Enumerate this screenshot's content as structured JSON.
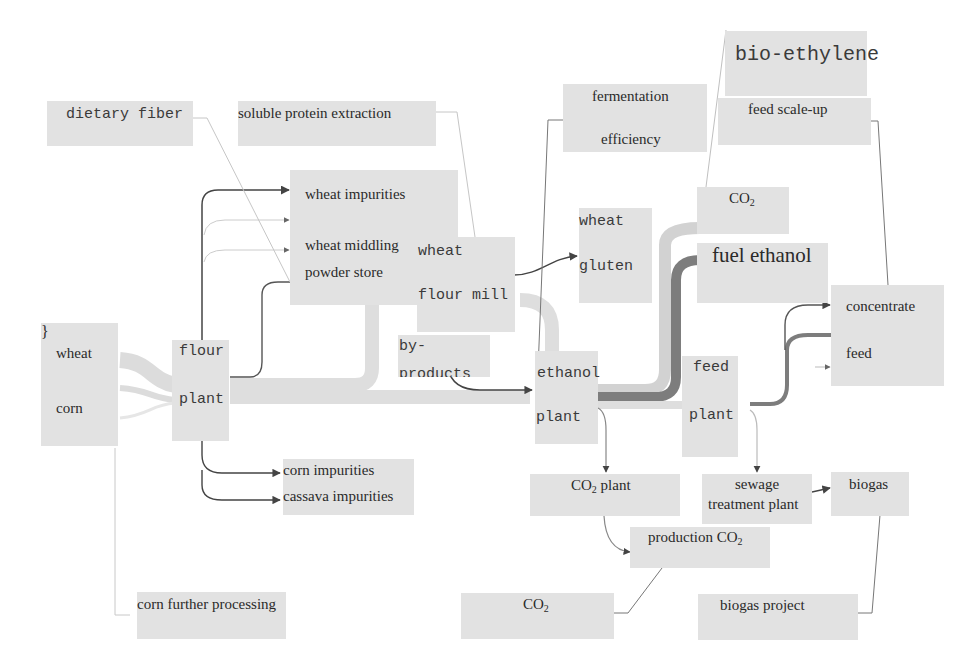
{
  "diagram": {
    "type": "sankey-style process flow",
    "palette": {
      "box": "#e2e2e2",
      "light_flow": "#dcdcdc",
      "dark_flow": "#7d7d7d",
      "arrow": "#4a4a4a",
      "thin_line": "#b0b0b0",
      "text": "#2a2a2a"
    },
    "nodes": {
      "raw_material": {
        "line1": "wheat",
        "line2": "corn"
      },
      "flour_plant": {
        "line1": "flour",
        "line2": "plant"
      },
      "wheat_products": {
        "line1": "wheat impurities",
        "line2": "wheat middling",
        "line3": "powder store"
      },
      "wheat_flour_mill": {
        "line1": "wheat",
        "line2": "flour mill"
      },
      "by_products": {
        "line1": "by-",
        "line2": "products"
      },
      "wheat_gluten": {
        "line1": "wheat",
        "line2": "gluten"
      },
      "ethanol_plant": {
        "line1": "ethanol",
        "line2": "plant"
      },
      "co2_top": {
        "base": "CO",
        "sub": "2"
      },
      "fuel_ethanol": {
        "label": "fuel ethanol"
      },
      "feed_plant": {
        "line1": "feed",
        "line2": "plant"
      },
      "concentrate_feed": {
        "line1": "concentrate",
        "line2": "feed"
      },
      "impurities_bottom": {
        "line1": "corn impurities",
        "line2": "cassava impurities"
      },
      "co2_plant": {
        "base": "CO",
        "sub": "2",
        "rest": " plant"
      },
      "sewage_plant": {
        "line1": "sewage",
        "line2": "treatment plant"
      },
      "biogas": {
        "label": "biogas"
      },
      "production_co2": {
        "base": "production CO",
        "sub": "2"
      }
    },
    "annotations": {
      "dietary_fiber": "dietary fiber",
      "soluble_protein": "soluble protein extraction",
      "fermentation": {
        "line1": "fermentation",
        "line2": "efficiency"
      },
      "bio_ethylene": "bio-ethylene",
      "feed_scale_up": "feed scale-up",
      "corn_further": "corn further processing",
      "co2_bottom": {
        "base": "CO",
        "sub": "2"
      },
      "biogas_project": "biogas project"
    }
  }
}
